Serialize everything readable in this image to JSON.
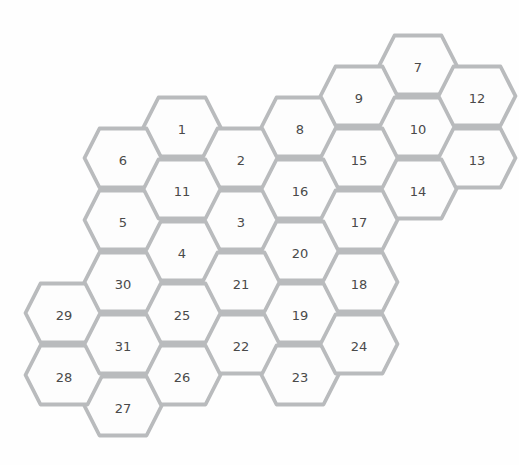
{
  "figure": {
    "background_color": "#fefefe",
    "hex_fill_color": "#fdfdfd",
    "hex_border_color": "#b9bbbd",
    "label_color": "#4a4a4a"
  },
  "grid": {
    "origin_x": 64,
    "origin_y": 65,
    "col_spacing": 59,
    "row_spacing": 31,
    "hex_width": 77,
    "hex_height": 59,
    "hex_flat_edge": 47,
    "border_width": 3.8,
    "label_offset_y": 2
  },
  "cells": [
    {
      "label": "1",
      "col": 2,
      "row": 2
    },
    {
      "label": "2",
      "col": 3,
      "row": 3
    },
    {
      "label": "3",
      "col": 3,
      "row": 5
    },
    {
      "label": "4",
      "col": 2,
      "row": 6
    },
    {
      "label": "5",
      "col": 1,
      "row": 5
    },
    {
      "label": "6",
      "col": 1,
      "row": 3
    },
    {
      "label": "7",
      "col": 6,
      "row": 0
    },
    {
      "label": "8",
      "col": 4,
      "row": 2
    },
    {
      "label": "9",
      "col": 5,
      "row": 1
    },
    {
      "label": "10",
      "col": 6,
      "row": 2
    },
    {
      "label": "11",
      "col": 2,
      "row": 4
    },
    {
      "label": "12",
      "col": 7,
      "row": 1
    },
    {
      "label": "13",
      "col": 7,
      "row": 3
    },
    {
      "label": "14",
      "col": 6,
      "row": 4
    },
    {
      "label": "15",
      "col": 5,
      "row": 3
    },
    {
      "label": "16",
      "col": 4,
      "row": 4
    },
    {
      "label": "17",
      "col": 5,
      "row": 5
    },
    {
      "label": "18",
      "col": 5,
      "row": 7
    },
    {
      "label": "19",
      "col": 4,
      "row": 8
    },
    {
      "label": "20",
      "col": 4,
      "row": 6
    },
    {
      "label": "21",
      "col": 3,
      "row": 7
    },
    {
      "label": "22",
      "col": 3,
      "row": 9
    },
    {
      "label": "23",
      "col": 4,
      "row": 10
    },
    {
      "label": "24",
      "col": 5,
      "row": 9
    },
    {
      "label": "25",
      "col": 2,
      "row": 8
    },
    {
      "label": "26",
      "col": 2,
      "row": 10
    },
    {
      "label": "27",
      "col": 1,
      "row": 11
    },
    {
      "label": "28",
      "col": 0,
      "row": 10
    },
    {
      "label": "29",
      "col": 0,
      "row": 8
    },
    {
      "label": "30",
      "col": 1,
      "row": 7
    },
    {
      "label": "31",
      "col": 1,
      "row": 9
    }
  ]
}
